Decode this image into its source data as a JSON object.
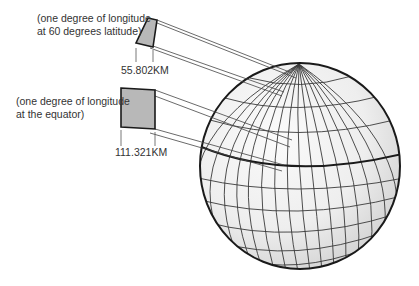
{
  "diagram": {
    "type": "globe-longitude-degree-comparison",
    "callouts": [
      {
        "id": "lat60",
        "label_line1": "(one degree of longitude",
        "label_line2": "at 60 degrees latitude)",
        "measurement": "55.802KM"
      },
      {
        "id": "equator",
        "label_line1": "(one degree of longitude",
        "label_line2": "at the equator)",
        "measurement": "111.321KM"
      }
    ],
    "colors": {
      "outline": "#1a1a1a",
      "grid": "#3a3a3a",
      "patch_fill": "#b8b8b8",
      "globe_fill": "#eeeeee",
      "text": "#333333"
    }
  }
}
